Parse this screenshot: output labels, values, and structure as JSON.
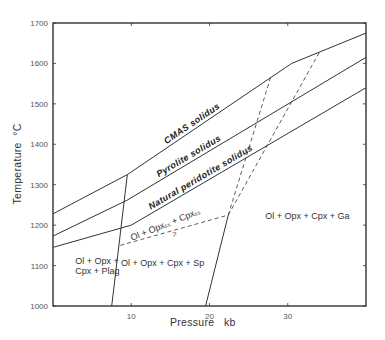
{
  "chart_data": {
    "type": "line",
    "title": "",
    "xlabel": "Pressure   kb",
    "ylabel": "Temperature  °C",
    "xlim": [
      0,
      40
    ],
    "ylim": [
      1000,
      1700
    ],
    "xticks": [
      10,
      20,
      30
    ],
    "yticks": [
      1000,
      1100,
      1200,
      1300,
      1400,
      1500,
      1600,
      1700
    ],
    "grid": false,
    "legend": "none",
    "series": [
      {
        "name": "CMAS solidus",
        "style": "solid",
        "label": "CMAS  solidus",
        "points": [
          [
            0,
            1228
          ],
          [
            9.5,
            1325
          ],
          [
            30.5,
            1600
          ],
          [
            40,
            1675
          ]
        ]
      },
      {
        "name": "Pyrolite solidus",
        "style": "solid",
        "label": "Pyrolite  solidus",
        "points": [
          [
            0,
            1173
          ],
          [
            9.5,
            1262
          ],
          [
            40,
            1615
          ]
        ]
      },
      {
        "name": "Natural peridotite solidus",
        "style": "solid",
        "label": "Natural  peridotite  solidus",
        "points": [
          [
            0,
            1145
          ],
          [
            10,
            1200
          ],
          [
            40,
            1540
          ]
        ]
      },
      {
        "name": "Plagioclase-spinel boundary",
        "style": "solid",
        "points": [
          [
            7.5,
            1000
          ],
          [
            9.5,
            1325
          ]
        ]
      },
      {
        "name": "Spinel-garnet boundary",
        "style": "solid",
        "points": [
          [
            19.5,
            1000
          ],
          [
            22.4,
            1225
          ]
        ]
      },
      {
        "name": "Ol+Opx+Cpx lower boundary",
        "style": "dashed",
        "points": [
          [
            8.6,
            1150
          ],
          [
            22.4,
            1225
          ]
        ]
      },
      {
        "name": "Dashed boundary A",
        "style": "dashed",
        "points": [
          [
            22.4,
            1225
          ],
          [
            27.8,
            1565
          ]
        ]
      },
      {
        "name": "Dashed boundary B",
        "style": "dashed",
        "points": [
          [
            22.4,
            1225
          ],
          [
            34.2,
            1633
          ]
        ]
      }
    ],
    "annotations": [
      {
        "text": "Ol + Opx +",
        "x": 4.0,
        "y": 1105
      },
      {
        "text": "Cpx + Plag",
        "x": 4.0,
        "y": 1080
      },
      {
        "text": "Ol + Opx + Cpx + Sp",
        "x": 14.0,
        "y": 1100
      },
      {
        "text": "Ol + Opx + Cpx + Ga",
        "x": 32.5,
        "y": 1215
      },
      {
        "text": "Ol + Opxₛₛ + Cpxₛₛ",
        "x": 14.5,
        "y": 1195
      },
      {
        "text": "?",
        "x": 15.5,
        "y": 1170
      }
    ]
  }
}
